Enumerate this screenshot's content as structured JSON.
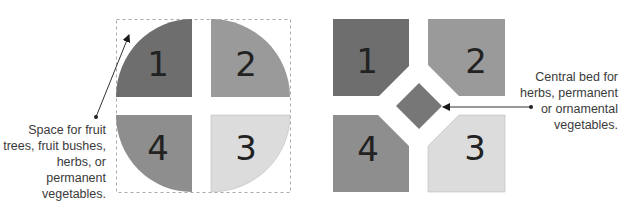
{
  "left_diagram": {
    "beds": [
      {
        "label": "1",
        "color": "#6e6e6e"
      },
      {
        "label": "2",
        "color": "#9a9a9a"
      },
      {
        "label": "3",
        "color": "#dcdcdc"
      },
      {
        "label": "4",
        "color": "#8e8e8e"
      }
    ],
    "caption": "Space for fruit\ntrees, fruit bushes,\nherbs, or permanent\nvegetables."
  },
  "right_diagram": {
    "beds": [
      {
        "label": "1",
        "color": "#6e6e6e"
      },
      {
        "label": "2",
        "color": "#9a9a9a"
      },
      {
        "label": "3",
        "color": "#dcdcdc"
      },
      {
        "label": "4",
        "color": "#8e8e8e"
      }
    ],
    "center_bed_color": "#777777",
    "caption": "Central bed for\nherbs, permanent\nor ornamental\nvegetables."
  }
}
